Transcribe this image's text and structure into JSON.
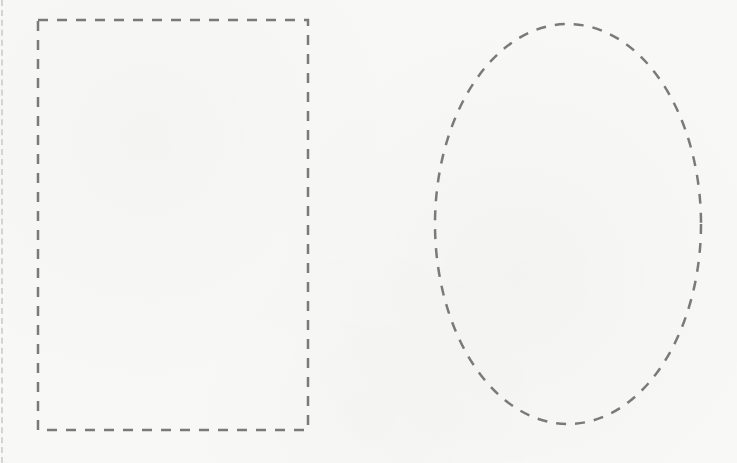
{
  "canvas": {
    "width": 737,
    "height": 463,
    "background": "#f8f8f7"
  },
  "shapes": {
    "rectangle": {
      "x": 38,
      "y": 20,
      "width": 270,
      "height": 410,
      "stroke": "#7a7a7a",
      "stroke_width": 2.5,
      "dash": "10 9"
    },
    "ellipse": {
      "cx": 568,
      "cy": 224,
      "rx": 133,
      "ry": 200,
      "stroke": "#7a7a7a",
      "stroke_width": 2.5,
      "dash": "10 9"
    }
  }
}
